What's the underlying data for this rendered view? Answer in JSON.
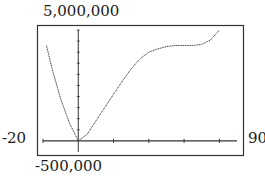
{
  "window": {
    "xmin": "-20",
    "xmax": "90",
    "ymin": "-500,000",
    "ymax": "5,000,000"
  },
  "chart_data": {
    "type": "line",
    "title": "",
    "xlabel": "",
    "ylabel": "",
    "xlim": [
      -20,
      90
    ],
    "ylim": [
      -500000,
      5000000
    ],
    "x_tick_interval": 10,
    "y_tick_interval": 500000,
    "grid": false,
    "frame_labels": {
      "left": "-20",
      "right": "90",
      "top": "5,000,000",
      "bottom": "-500,000"
    },
    "series": [
      {
        "name": "y",
        "x": [
          -18,
          -15,
          -10,
          -5,
          0,
          5,
          10,
          15,
          20,
          25,
          30,
          35,
          40,
          45,
          50,
          55,
          60,
          65,
          70,
          75,
          80
        ],
        "y": [
          4300000,
          3300000,
          1900000,
          800000,
          0,
          300000,
          900000,
          1500000,
          2100000,
          2700000,
          3250000,
          3700000,
          4000000,
          4150000,
          4250000,
          4300000,
          4300000,
          4300000,
          4350000,
          4550000,
          5000000
        ]
      }
    ]
  }
}
